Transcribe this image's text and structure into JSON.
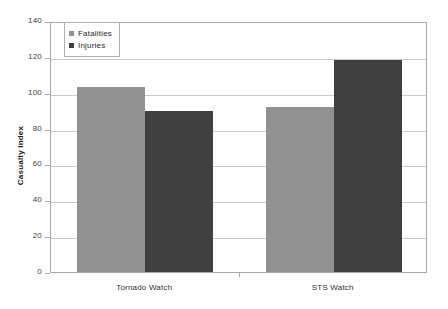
{
  "chart_data": {
    "type": "bar",
    "title": "",
    "xlabel": "",
    "ylabel": "Casualty Index",
    "categories": [
      "Tornado Watch",
      "STS Watch"
    ],
    "series": [
      {
        "name": "Fatalities",
        "color": "#919191",
        "values": [
          103,
          92
        ]
      },
      {
        "name": "Injuries",
        "color": "#3f3f3f",
        "values": [
          90,
          118
        ]
      }
    ],
    "ylim": [
      0,
      140
    ],
    "ytick_labels": [
      "0",
      "20",
      "40",
      "60",
      "80",
      "100",
      "120",
      "140"
    ],
    "ytick_values": [
      0,
      20,
      40,
      60,
      80,
      100,
      120,
      140
    ],
    "grid": "horizontal",
    "legend_position": "top-left-inside"
  },
  "legend": {
    "entries": [
      {
        "label": "Fatalities",
        "swatch": "legend-swatch-fatalities"
      },
      {
        "label": "Injuries",
        "swatch": "legend-swatch-injuries"
      }
    ]
  },
  "axis": {
    "y_title": "Casualty Index"
  }
}
